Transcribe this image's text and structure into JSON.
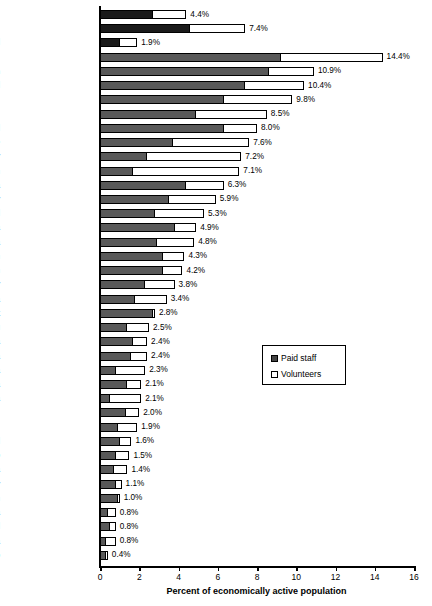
{
  "chart_data": {
    "type": "bar",
    "orientation": "horizontal",
    "stacked": true,
    "title": "",
    "xlabel": "Percent of economically active population",
    "ylabel": "",
    "xlim": [
      0,
      16
    ],
    "xticks": [
      0,
      2,
      4,
      6,
      8,
      10,
      12,
      14,
      16
    ],
    "xtick_labels": [
      "0",
      "2",
      "4",
      "6",
      "8",
      "10",
      "12",
      "14",
      "16"
    ],
    "grid": false,
    "legend": {
      "position": "middle-right",
      "entries": [
        {
          "label": "Paid staff",
          "swatch": "filled"
        },
        {
          "label": "Volunteers",
          "swatch": "empty"
        }
      ]
    },
    "categories": [
      "36 countries",
      "Developed countries",
      "Developing / transitional",
      "Netherlands",
      "Belgium",
      "Ireland",
      "U.S.",
      "U.K.",
      "Israel",
      "France",
      "Norway",
      "Sweden",
      "Australia",
      "Germany",
      "Finland",
      "Austria",
      "Argentina",
      "Spain",
      "Japan",
      "Italy",
      "South Africa",
      "Egypt",
      "Peru",
      "South Korea",
      "Colombia",
      "Uganda",
      "Kenya",
      "Tanzania",
      "Czech Rep.",
      "Philippines",
      "Brazil",
      "Morocco",
      "India",
      "Hungary",
      "Pakistan",
      "Slovakia",
      "Poland",
      "Romania",
      "Mexico"
    ],
    "series": [
      {
        "name": "Paid staff",
        "values": [
          2.7,
          4.6,
          1.0,
          9.2,
          8.6,
          7.4,
          6.3,
          4.9,
          6.3,
          3.7,
          2.4,
          1.7,
          4.4,
          3.5,
          2.8,
          3.8,
          2.9,
          3.2,
          3.2,
          2.3,
          1.8,
          2.7,
          1.4,
          1.7,
          1.6,
          0.8,
          1.4,
          0.5,
          1.3,
          0.9,
          1.0,
          0.8,
          0.7,
          0.8,
          0.9,
          0.4,
          0.5,
          0.3,
          0.3
        ]
      },
      {
        "name": "Volunteers",
        "values": [
          1.7,
          2.8,
          0.9,
          5.2,
          2.3,
          3.0,
          3.5,
          3.6,
          1.7,
          3.9,
          4.8,
          5.4,
          1.9,
          2.4,
          2.5,
          1.1,
          1.9,
          1.1,
          1.0,
          1.5,
          1.6,
          0.1,
          1.1,
          0.7,
          0.8,
          1.5,
          0.7,
          1.6,
          0.7,
          1.0,
          0.6,
          0.7,
          0.7,
          0.3,
          0.1,
          0.4,
          0.3,
          0.5,
          0.1
        ]
      }
    ],
    "totals": [
      4.4,
      7.4,
      1.9,
      14.4,
      10.9,
      10.4,
      9.8,
      8.5,
      8.0,
      7.6,
      7.2,
      7.1,
      6.3,
      5.9,
      5.3,
      4.9,
      4.8,
      4.3,
      4.2,
      3.8,
      3.4,
      2.8,
      2.5,
      2.4,
      2.4,
      2.3,
      2.1,
      2.1,
      2.0,
      1.9,
      1.6,
      1.5,
      1.4,
      1.1,
      1.0,
      0.8,
      0.8,
      0.8,
      0.4
    ],
    "value_labels": [
      "4.4%",
      "7.4%",
      "1.9%",
      "14.4%",
      "10.9%",
      "10.4%",
      "9.8%",
      "8.5%",
      "8.0%",
      "7.6%",
      "7.2%",
      "7.1%",
      "6.3%",
      "5.9%",
      "5.3%",
      "4.9%",
      "4.8%",
      "4.3%",
      "4.2%",
      "3.8%",
      "3.4%",
      "2.8%",
      "2.5%",
      "2.4%",
      "2.4%",
      "2.3%",
      "2.1%",
      "2.1%",
      "2.0%",
      "1.9%",
      "1.6%",
      "1.5%",
      "1.4%",
      "1.1%",
      "1.0%",
      "0.8%",
      "0.8%",
      "0.8%",
      "0.4%"
    ],
    "aggregate_row_count": 3,
    "colors": {
      "paid_staff": "#595959",
      "paid_staff_aggregate": "#1a1a1a",
      "volunteers": "#ffffff",
      "outline": "#000000",
      "background": "#ffffff"
    }
  }
}
